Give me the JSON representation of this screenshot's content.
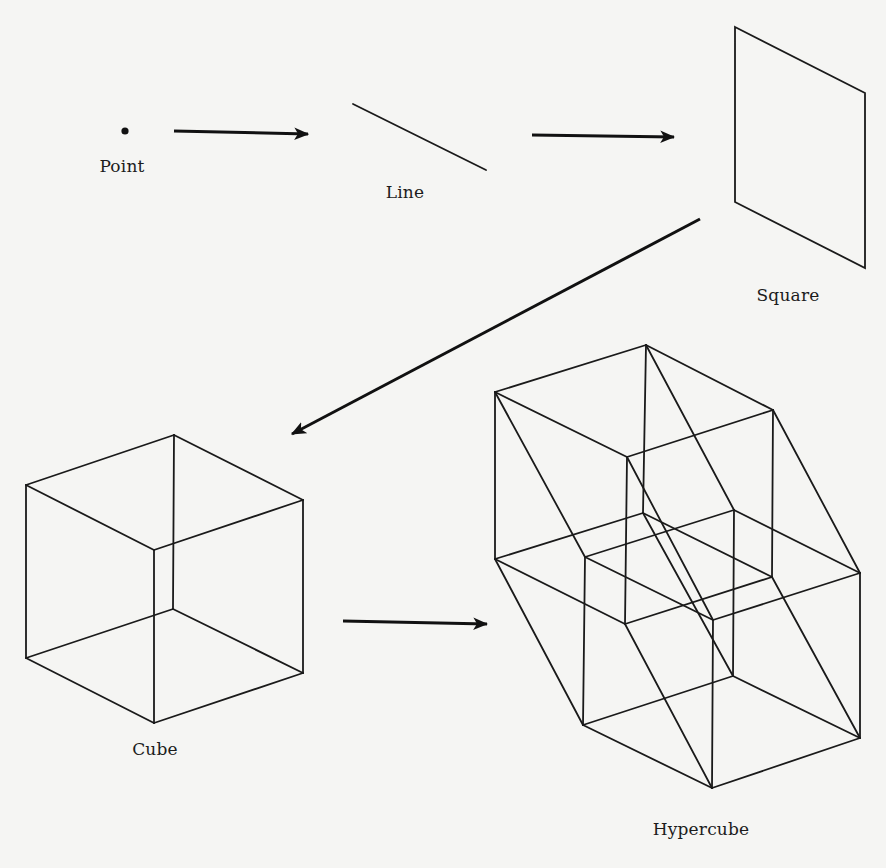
{
  "colors": {
    "background": "#f5f5f3",
    "ink": "#1a1a1a"
  },
  "figure": {
    "stages": [
      {
        "id": "point",
        "label": "Point",
        "dimension": 0
      },
      {
        "id": "line",
        "label": "Line",
        "dimension": 1
      },
      {
        "id": "square",
        "label": "Square",
        "dimension": 2
      },
      {
        "id": "cube",
        "label": "Cube",
        "dimension": 3
      },
      {
        "id": "hypercube",
        "label": "Hypercube",
        "dimension": 4
      }
    ],
    "arrows": [
      {
        "from": "point",
        "to": "line"
      },
      {
        "from": "line",
        "to": "square"
      },
      {
        "from": "square",
        "to": "cube"
      },
      {
        "from": "cube",
        "to": "hypercube"
      }
    ]
  },
  "labels": {
    "point": "Point",
    "line": "Line",
    "square": "Square",
    "cube": "Cube",
    "hypercube": "Hypercube"
  }
}
